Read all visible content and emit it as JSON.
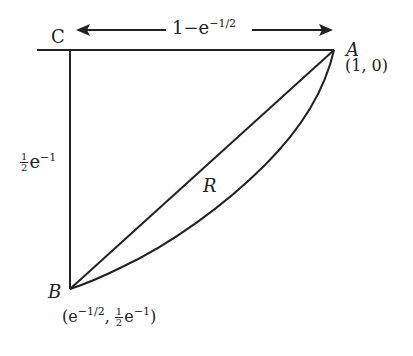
{
  "diagram": {
    "points": {
      "A": {
        "label": "A",
        "coord": "(1, 0)"
      },
      "B": {
        "label": "B",
        "coord_open": "(e",
        "coord_exp1": "−1/2",
        "coord_mid": ",",
        "coord_frac_num": "1",
        "coord_frac_den": "2",
        "coord_e": "e",
        "coord_exp2": "−1",
        "coord_close": ")"
      },
      "C": {
        "label": "C"
      }
    },
    "region_label": "R",
    "horizontal_dimension": {
      "base": "1−e",
      "exp": "−1/2"
    },
    "vertical_dimension": {
      "frac_num": "1",
      "frac_den": "2",
      "base": "e",
      "exp": "−1"
    },
    "stroke_color": "#222222",
    "background": "#ffffff"
  }
}
